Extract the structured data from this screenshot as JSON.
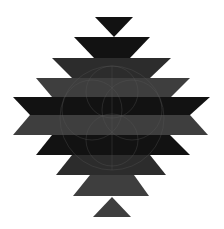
{
  "image": {
    "subject": "Southwestern stepped diamond pattern with faint circular line motif",
    "colors": {
      "background": "#ffffff",
      "black": "#121212",
      "dark_gray": "#2c2c2c",
      "mid_gray": "#3e3e3e",
      "line": "#5a5a5a"
    },
    "shapes": [
      {
        "name": "top-triangle",
        "tone": "black"
      },
      {
        "name": "band-1",
        "tone": "black"
      },
      {
        "name": "band-2",
        "tone": "dark_gray"
      },
      {
        "name": "band-3",
        "tone": "mid_gray"
      },
      {
        "name": "band-4",
        "tone": "black"
      },
      {
        "name": "band-5",
        "tone": "mid_gray"
      },
      {
        "name": "band-6",
        "tone": "black"
      },
      {
        "name": "band-7",
        "tone": "dark_gray"
      },
      {
        "name": "band-8",
        "tone": "mid_gray"
      },
      {
        "name": "bottom-triangle",
        "tone": "mid_gray"
      }
    ]
  }
}
